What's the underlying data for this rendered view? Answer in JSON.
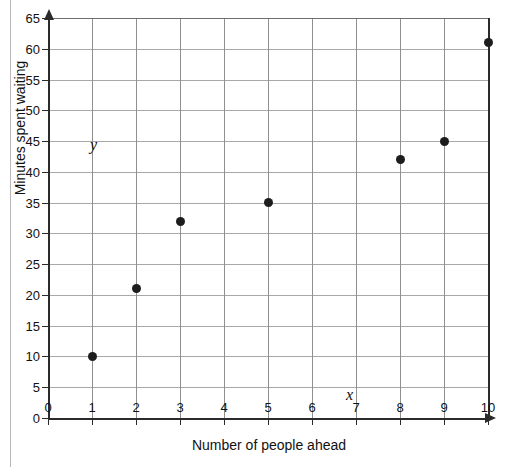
{
  "page": {
    "top_text_remnant": "",
    "background_color": "#ffffff",
    "margin_rule_color": "#b9b9b9"
  },
  "chart_data": {
    "type": "scatter",
    "title": "",
    "xlabel": "Number of people ahead",
    "ylabel": "Minutes spent waiting",
    "x_variable_label": "x",
    "y_variable_label": "y",
    "xlim": [
      0,
      10
    ],
    "ylim": [
      0,
      65
    ],
    "x_tick_step": 1,
    "y_tick_step": 5,
    "xticks": [
      "0",
      "1",
      "2",
      "3",
      "4",
      "5",
      "6",
      "7",
      "8",
      "9",
      "10"
    ],
    "yticks": [
      "0",
      "5",
      "10",
      "15",
      "20",
      "25",
      "30",
      "35",
      "40",
      "45",
      "50",
      "55",
      "60",
      "65"
    ],
    "grid": true,
    "legend": false,
    "point_color": "#1d1d1d",
    "axis_color": "#2b2b2b",
    "grid_color": "#a8a8a8",
    "points": [
      {
        "x": 1,
        "y": 10
      },
      {
        "x": 2,
        "y": 21
      },
      {
        "x": 3,
        "y": 32
      },
      {
        "x": 5,
        "y": 35
      },
      {
        "x": 8,
        "y": 42
      },
      {
        "x": 9,
        "y": 45
      },
      {
        "x": 10,
        "y": 61
      }
    ],
    "x": [
      1,
      2,
      3,
      5,
      8,
      9,
      10
    ],
    "values": [
      10,
      21,
      32,
      35,
      42,
      45,
      61
    ]
  }
}
